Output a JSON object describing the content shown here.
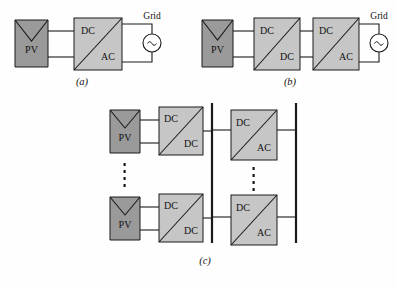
{
  "figure": {
    "background_color": "#fefefe",
    "pv_color": "#9a9a9a",
    "converter_color": "#c6c6c6",
    "line_color": "#1a1a1a"
  },
  "labels": {
    "pv": "PV",
    "dc": "DC",
    "ac": "AC",
    "grid": "Grid",
    "vertical_ellipsis": "⋮"
  },
  "captions": {
    "a": "(a)",
    "b": "(b)",
    "c": "(c)"
  },
  "panel_a": {
    "caption": "(a)",
    "source_label": "PV",
    "converter": {
      "top_label": "DC",
      "bottom_label": "AC"
    },
    "grid_label": "Grid"
  },
  "panel_b": {
    "caption": "(b)",
    "source_label": "PV",
    "converter_1": {
      "top_label": "DC",
      "bottom_label": "DC"
    },
    "converter_2": {
      "top_label": "DC",
      "bottom_label": "AC"
    },
    "grid_label": "Grid"
  },
  "panel_c": {
    "caption": "(c)",
    "string_top": {
      "source_label": "PV",
      "converter": {
        "top_label": "DC",
        "bottom_label": "DC"
      }
    },
    "string_bottom": {
      "source_label": "PV",
      "converter": {
        "top_label": "DC",
        "bottom_label": "DC"
      }
    },
    "inverter_top": {
      "top_label": "DC",
      "bottom_label": "AC"
    },
    "inverter_bottom": {
      "top_label": "DC",
      "bottom_label": "AC"
    },
    "left_ellipsis": "⋮",
    "right_ellipsis": "⋮"
  }
}
